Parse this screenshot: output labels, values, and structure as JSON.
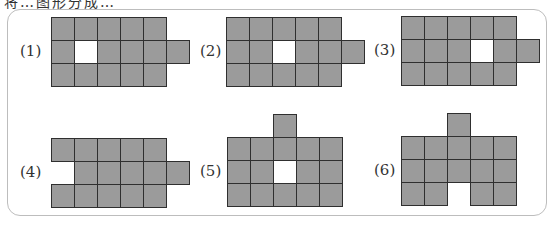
{
  "header": {
    "clipped_text": "将…图形分成…"
  },
  "figures": [
    {
      "label": "(1)",
      "label_x": 20,
      "label_y": 42,
      "origin_x": 51,
      "origin_y": 17,
      "cells": [
        [
          0,
          0,
          "g"
        ],
        [
          1,
          0,
          "g"
        ],
        [
          2,
          0,
          "g"
        ],
        [
          3,
          0,
          "g"
        ],
        [
          4,
          0,
          "g"
        ],
        [
          0,
          1,
          "g"
        ],
        [
          1,
          1,
          "w"
        ],
        [
          2,
          1,
          "g"
        ],
        [
          3,
          1,
          "g"
        ],
        [
          4,
          1,
          "g"
        ],
        [
          5,
          1,
          "g"
        ],
        [
          0,
          2,
          "g"
        ],
        [
          1,
          2,
          "g"
        ],
        [
          2,
          2,
          "g"
        ],
        [
          3,
          2,
          "g"
        ],
        [
          4,
          2,
          "g"
        ]
      ]
    },
    {
      "label": "(2)",
      "label_x": 200,
      "label_y": 42,
      "origin_x": 226,
      "origin_y": 17,
      "cells": [
        [
          0,
          0,
          "g"
        ],
        [
          1,
          0,
          "g"
        ],
        [
          2,
          0,
          "g"
        ],
        [
          3,
          0,
          "g"
        ],
        [
          4,
          0,
          "g"
        ],
        [
          0,
          1,
          "g"
        ],
        [
          1,
          1,
          "g"
        ],
        [
          2,
          1,
          "w"
        ],
        [
          3,
          1,
          "g"
        ],
        [
          4,
          1,
          "g"
        ],
        [
          5,
          1,
          "g"
        ],
        [
          0,
          2,
          "g"
        ],
        [
          1,
          2,
          "g"
        ],
        [
          2,
          2,
          "g"
        ],
        [
          3,
          2,
          "g"
        ],
        [
          4,
          2,
          "g"
        ]
      ]
    },
    {
      "label": "(3)",
      "label_x": 374,
      "label_y": 41,
      "origin_x": 401,
      "origin_y": 16,
      "cells": [
        [
          0,
          0,
          "g"
        ],
        [
          1,
          0,
          "g"
        ],
        [
          2,
          0,
          "g"
        ],
        [
          3,
          0,
          "g"
        ],
        [
          4,
          0,
          "g"
        ],
        [
          0,
          1,
          "g"
        ],
        [
          1,
          1,
          "g"
        ],
        [
          2,
          1,
          "g"
        ],
        [
          3,
          1,
          "w"
        ],
        [
          4,
          1,
          "g"
        ],
        [
          5,
          1,
          "g"
        ],
        [
          0,
          2,
          "g"
        ],
        [
          1,
          2,
          "g"
        ],
        [
          2,
          2,
          "g"
        ],
        [
          3,
          2,
          "g"
        ],
        [
          4,
          2,
          "g"
        ]
      ]
    },
    {
      "label": "(4)",
      "label_x": 20,
      "label_y": 163,
      "origin_x": 51,
      "origin_y": 138,
      "cells": [
        [
          0,
          0,
          "g"
        ],
        [
          1,
          0,
          "g"
        ],
        [
          2,
          0,
          "g"
        ],
        [
          3,
          0,
          "g"
        ],
        [
          4,
          0,
          "g"
        ],
        [
          1,
          1,
          "g"
        ],
        [
          2,
          1,
          "g"
        ],
        [
          3,
          1,
          "g"
        ],
        [
          4,
          1,
          "g"
        ],
        [
          5,
          1,
          "g"
        ],
        [
          0,
          2,
          "g"
        ],
        [
          1,
          2,
          "g"
        ],
        [
          2,
          2,
          "g"
        ],
        [
          3,
          2,
          "g"
        ],
        [
          4,
          2,
          "g"
        ]
      ]
    },
    {
      "label": "(5)",
      "label_x": 200,
      "label_y": 162,
      "origin_x": 227,
      "origin_y": 114,
      "cells": [
        [
          2,
          0,
          "g"
        ],
        [
          0,
          1,
          "g"
        ],
        [
          1,
          1,
          "g"
        ],
        [
          2,
          1,
          "g"
        ],
        [
          3,
          1,
          "g"
        ],
        [
          4,
          1,
          "g"
        ],
        [
          0,
          2,
          "g"
        ],
        [
          1,
          2,
          "g"
        ],
        [
          2,
          2,
          "w"
        ],
        [
          3,
          2,
          "g"
        ],
        [
          4,
          2,
          "g"
        ],
        [
          0,
          3,
          "g"
        ],
        [
          1,
          3,
          "g"
        ],
        [
          2,
          3,
          "g"
        ],
        [
          3,
          3,
          "g"
        ],
        [
          4,
          3,
          "g"
        ]
      ]
    },
    {
      "label": "(6)",
      "label_x": 374,
      "label_y": 161,
      "origin_x": 401,
      "origin_y": 113,
      "cells": [
        [
          2,
          0,
          "g"
        ],
        [
          0,
          1,
          "g"
        ],
        [
          1,
          1,
          "g"
        ],
        [
          2,
          1,
          "g"
        ],
        [
          3,
          1,
          "g"
        ],
        [
          4,
          1,
          "g"
        ],
        [
          0,
          2,
          "g"
        ],
        [
          1,
          2,
          "g"
        ],
        [
          2,
          2,
          "g"
        ],
        [
          3,
          2,
          "g"
        ],
        [
          4,
          2,
          "g"
        ],
        [
          0,
          3,
          "g"
        ],
        [
          1,
          3,
          "g"
        ],
        [
          3,
          3,
          "g"
        ],
        [
          4,
          3,
          "g"
        ]
      ]
    }
  ],
  "style": {
    "cell_size": 23,
    "fill_gray": "#9b9b9b",
    "fill_white": "#ffffff",
    "line": "#2f2f2f"
  }
}
